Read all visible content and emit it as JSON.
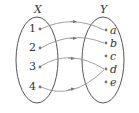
{
  "diagram": {
    "type": "function-mapping",
    "colors": {
      "stroke": "#555555",
      "text": "#333333",
      "dot": "#777777",
      "arrow": "#777777"
    },
    "domain_set": {
      "name": "X",
      "elements": [
        "1",
        "2",
        "3",
        "4"
      ]
    },
    "codomain_set": {
      "name": "Y",
      "elements": [
        "a",
        "b",
        "c",
        "d",
        "e"
      ]
    },
    "mappings": [
      {
        "from": "1",
        "to": "a"
      },
      {
        "from": "2",
        "to": "b"
      },
      {
        "from": "3",
        "to": "d"
      },
      {
        "from": "4",
        "to": "d"
      }
    ]
  }
}
